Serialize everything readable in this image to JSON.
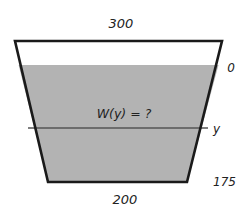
{
  "diagram": {
    "type": "trapezoidal tank cross-section",
    "labels": {
      "top_width": "300",
      "bottom_width": "200",
      "water_surface_depth": "0",
      "slice_depth": "y",
      "bottom_depth": "175",
      "width_question": "W(y) = ?"
    },
    "colors": {
      "water_fill": "#b3b3b3",
      "outline": "#1a1a1a",
      "slice_line": "#555555",
      "background": "#ffffff"
    },
    "geometry": {
      "top_left": [
        15,
        41
      ],
      "top_right": [
        222,
        41
      ],
      "bottom_left": [
        48,
        182
      ],
      "bottom_right": [
        187,
        182
      ],
      "water_line_y": 65,
      "slice_line_y": 128
    }
  }
}
